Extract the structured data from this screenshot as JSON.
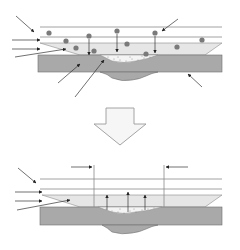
{
  "diagram": {
    "colors": {
      "background": "#ffffff",
      "substrate": "#a9a9a9",
      "substrate_stroke": "#6e6e6e",
      "layer": "#e6e6e6",
      "deposit": "#f4f4f4",
      "particle": "#7a7a7a",
      "line": "#8c8c8c",
      "arrow": "#222222",
      "big_arrow_fill": "#f6f6f6",
      "big_arrow_stroke": "#9a9a9a"
    },
    "top_panel": {
      "particles": [
        [
          49,
          33
        ],
        [
          66,
          41
        ],
        [
          76,
          48
        ],
        [
          89,
          36
        ],
        [
          94,
          51
        ],
        [
          117,
          31
        ],
        [
          127,
          44
        ],
        [
          146,
          54
        ],
        [
          155,
          33
        ],
        [
          177,
          47
        ],
        [
          202,
          40
        ]
      ]
    },
    "bottom_panel": {
      "bracket_left_x": 94,
      "bracket_right_x": 164
    }
  }
}
